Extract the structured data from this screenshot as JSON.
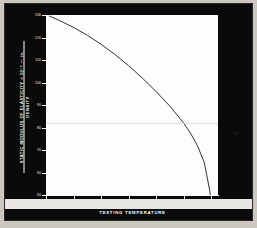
{
  "figure": {
    "page_mark": "17"
  },
  "chart_data": {
    "type": "line",
    "title": "",
    "xlabel": "TESTING TEMPERATURE",
    "ylabel_line1": "STATIC MODULUS OF ELASTICITY × 10⁻⁶ — in.",
    "ylabel_line2": "DENSITY",
    "xlim": [
      0,
      2500
    ],
    "ylim": [
      50,
      130
    ],
    "xticks": [
      0,
      400,
      800,
      1200,
      1600,
      2000,
      2400
    ],
    "xticklabels": [
      "0",
      "400",
      "800",
      "1200",
      "1600",
      "2000",
      "2400°F"
    ],
    "yticks": [
      50,
      60,
      70,
      80,
      90,
      100,
      110,
      120,
      130
    ],
    "yticklabels": [
      "50",
      "60",
      "70",
      "80",
      "90",
      "100",
      "110",
      "120",
      "130"
    ],
    "grid": false,
    "legend": null,
    "series": [
      {
        "name": "Static modulus of elasticity / density",
        "x": [
          50,
          200,
          400,
          600,
          800,
          1000,
          1200,
          1400,
          1600,
          1800,
          2000,
          2100,
          2200,
          2300,
          2380,
          2430
        ],
        "values": [
          129.5,
          127.5,
          124.5,
          121.0,
          117.0,
          112.5,
          107.5,
          102.0,
          96.0,
          89.5,
          82.0,
          77.5,
          72.0,
          64.5,
          52.0,
          38.0
        ]
      }
    ]
  }
}
